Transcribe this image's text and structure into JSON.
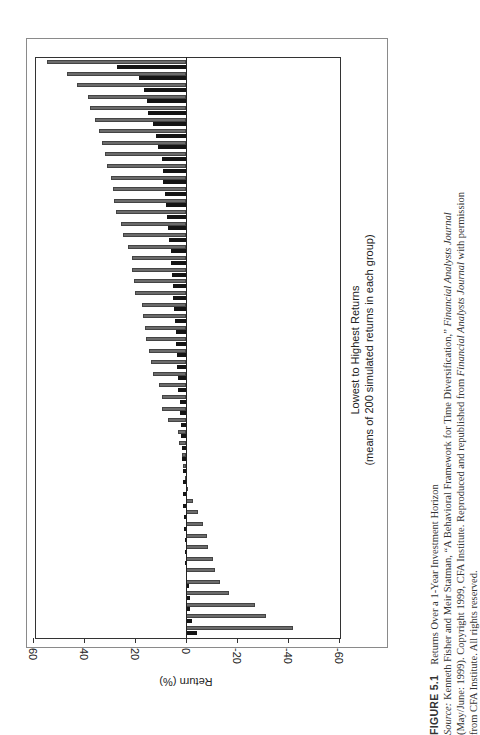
{
  "figure": {
    "number": "FIGURE 5.1",
    "title": "Returns Over a 1-Year Investment Horizon",
    "source_label": "Source:",
    "source_line1": "Kenneth Fisher and Meir Statman, “A Behavioral Framework for Time Diversification,”",
    "journal1": "Financial Analysts Journal",
    "source_line2": "(May/June: 1999). Copyright 1999, CFA Institute. Reproduced and republished from",
    "journal2": "Financial Analysts Journal",
    "source_line2b": "with permission",
    "source_line3": "from CFA Institute. All rights reserved."
  },
  "chart_data": {
    "type": "bar",
    "orientation": "rotated page (bars horizontal on page, value axis runs left-right reversed)",
    "title": "Returns Over a 1-Year Investment Horizon",
    "xlabel": "Lowest to Highest Returns",
    "xlabel_sub": "(means of 200 simulated returns in each group)",
    "ylabel": "Return (%)",
    "ylim": [
      -60,
      60
    ],
    "yticks": [
      60,
      40,
      20,
      0,
      -20,
      -40,
      -60
    ],
    "grid": false,
    "legend": null,
    "series": [
      {
        "name": "gray",
        "color": "#6b6b6b",
        "values": [
          54.5,
          46.7,
          42.7,
          38.4,
          37.6,
          35.7,
          34.0,
          32.9,
          31.6,
          31.1,
          29.4,
          28.5,
          28.2,
          27.5,
          25.6,
          24.6,
          22.7,
          21.3,
          21.2,
          20.5,
          19.9,
          17.3,
          16.7,
          16.0,
          15.8,
          14.5,
          13.7,
          12.8,
          10.5,
          9.3,
          9.3,
          6.9,
          3.1,
          2.6,
          1.6,
          1.1,
          0.5,
          -0.2,
          -2.6,
          -4.8,
          -6.7,
          -8.1,
          -8.6,
          -10.6,
          -11.4,
          -13.3,
          -16.7,
          -27.0,
          -31.4,
          -42.0
        ]
      },
      {
        "name": "black",
        "color": "#151515",
        "values": [
          27.0,
          18.4,
          16.5,
          15.3,
          14.9,
          12.9,
          11.8,
          11.0,
          9.4,
          9.0,
          9.0,
          8.2,
          7.8,
          7.6,
          7.1,
          6.5,
          6.0,
          6.0,
          5.5,
          5.2,
          5.2,
          4.7,
          4.3,
          3.9,
          3.9,
          3.6,
          3.4,
          3.0,
          3.0,
          2.5,
          2.5,
          2.0,
          2.0,
          1.5,
          1.5,
          1.2,
          1.0,
          1.0,
          1.0,
          0.8,
          0.6,
          0.5,
          0.3,
          0.2,
          -0.2,
          -1.0,
          -1.5,
          -1.5,
          -2.5,
          -4.5
        ]
      }
    ]
  }
}
